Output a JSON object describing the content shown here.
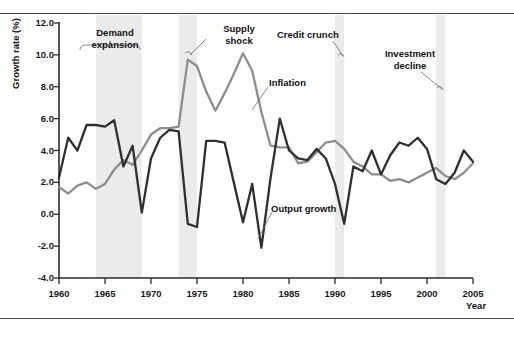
{
  "chart_data": {
    "type": "line",
    "title": "",
    "xlabel": "Year",
    "ylabel": "Growth rate (%)",
    "xlim": [
      1960,
      2005
    ],
    "ylim": [
      -4.0,
      12.0
    ],
    "grid": false,
    "legend_position": "inline-annotations",
    "xticks": [
      1960,
      1965,
      1970,
      1975,
      1980,
      1985,
      1990,
      1995,
      2000,
      2005
    ],
    "yticks": [
      -4.0,
      -2.0,
      0.0,
      2.0,
      4.0,
      6.0,
      8.0,
      10.0,
      12.0
    ],
    "ytick_labels": [
      "-4.0",
      "-2.0",
      "0.0",
      "2.0",
      "4.0",
      "6.0",
      "8.0",
      "10.0",
      "12.0"
    ],
    "x": [
      1960,
      1961,
      1962,
      1963,
      1964,
      1965,
      1966,
      1967,
      1968,
      1969,
      1970,
      1971,
      1972,
      1973,
      1974,
      1975,
      1976,
      1977,
      1978,
      1979,
      1980,
      1981,
      1982,
      1983,
      1984,
      1985,
      1986,
      1987,
      1988,
      1989,
      1990,
      1991,
      1992,
      1993,
      1994,
      1995,
      1996,
      1997,
      1998,
      1999,
      2000,
      2001,
      2002,
      2003,
      2004,
      2005
    ],
    "series": [
      {
        "name": "Output growth",
        "color": "#2f2f33",
        "values": [
          2.3,
          4.8,
          4.0,
          5.6,
          5.6,
          5.5,
          5.9,
          3.0,
          4.3,
          0.1,
          3.5,
          4.8,
          5.3,
          5.2,
          -0.6,
          -0.8,
          4.6,
          4.6,
          4.5,
          2.0,
          -0.5,
          1.9,
          -2.1,
          2.3,
          6.0,
          4.0,
          3.5,
          3.4,
          4.1,
          3.5,
          1.9,
          -0.6,
          3.0,
          2.7,
          4.0,
          2.5,
          3.7,
          4.5,
          4.3,
          4.8,
          4.1,
          2.2,
          1.9,
          2.6,
          4.0,
          3.3
        ]
      },
      {
        "name": "Inflation",
        "color": "#8d8d90",
        "values": [
          1.7,
          1.3,
          1.8,
          2.0,
          1.6,
          1.9,
          2.8,
          3.4,
          3.1,
          4.0,
          5.0,
          5.4,
          5.4,
          5.5,
          9.7,
          9.3,
          7.7,
          6.5,
          7.6,
          8.8,
          10.1,
          9.0,
          6.4,
          4.3,
          4.2,
          4.2,
          3.2,
          3.3,
          3.9,
          4.5,
          4.6,
          4.1,
          3.3,
          3.0,
          2.5,
          2.5,
          2.1,
          2.2,
          2.0,
          2.3,
          2.6,
          2.9,
          2.4,
          2.2,
          2.6,
          3.2
        ]
      }
    ],
    "annotations": [
      {
        "id": "demand-expansion",
        "label": "Demand\nexpansion",
        "line1": "Demand",
        "line2": "expansion",
        "band_start": 1964,
        "band_end": 1969,
        "style": "brace"
      },
      {
        "id": "supply-shock",
        "label": "Supply\nshock",
        "line1": "Supply",
        "line2": "shock",
        "band_start": 1973,
        "band_end": 1975,
        "style": "leader"
      },
      {
        "id": "credit-crunch",
        "label": "Credit crunch",
        "line1": "Credit crunch",
        "line2": "",
        "band_start": 1990,
        "band_end": 1991,
        "style": "leader"
      },
      {
        "id": "investment-decline",
        "label": "Investment\ndecline",
        "line1": "Investment",
        "line2": "decline",
        "band_start": 2001,
        "band_end": 2002,
        "style": "leader"
      },
      {
        "id": "inflation-label",
        "label": "Inflation",
        "line1": "Inflation",
        "line2": "",
        "style": "leader"
      },
      {
        "id": "output-growth-label",
        "label": "Output growth",
        "line1": "Output growth",
        "line2": "",
        "style": "leader"
      }
    ],
    "shaded_bands": [
      {
        "name": "demand-expansion-band",
        "start": 1964,
        "end": 1969
      },
      {
        "name": "supply-shock-band",
        "start": 1973,
        "end": 1975
      },
      {
        "name": "credit-crunch-band",
        "start": 1990,
        "end": 1991
      },
      {
        "name": "investment-decline-band",
        "start": 2001,
        "end": 2002
      }
    ]
  },
  "axes": {
    "y_title": "Growth rate (%)",
    "x_title": "Year",
    "y_tick_labels": [
      "12.0",
      "10.0",
      "8.0",
      "6.0",
      "4.0",
      "2.0",
      "0.0",
      "-2.0",
      "-4.0"
    ],
    "x_tick_labels": [
      "1960",
      "1965",
      "1970",
      "1975",
      "1980",
      "1985",
      "1990",
      "1995",
      "2000",
      "2005"
    ]
  },
  "annotations": {
    "demand_expansion_l1": "Demand",
    "demand_expansion_l2": "expansion",
    "supply_shock_l1": "Supply",
    "supply_shock_l2": "shock",
    "credit_crunch": "Credit crunch",
    "investment_decline_l1": "Investment",
    "investment_decline_l2": "decline",
    "inflation": "Inflation",
    "output_growth": "Output growth"
  },
  "colors": {
    "output_growth": "#2f2f33",
    "inflation": "#8d8d90",
    "band": "#ebebeb",
    "axis": "#2b2b2b",
    "rule": "#4a4a4a"
  }
}
